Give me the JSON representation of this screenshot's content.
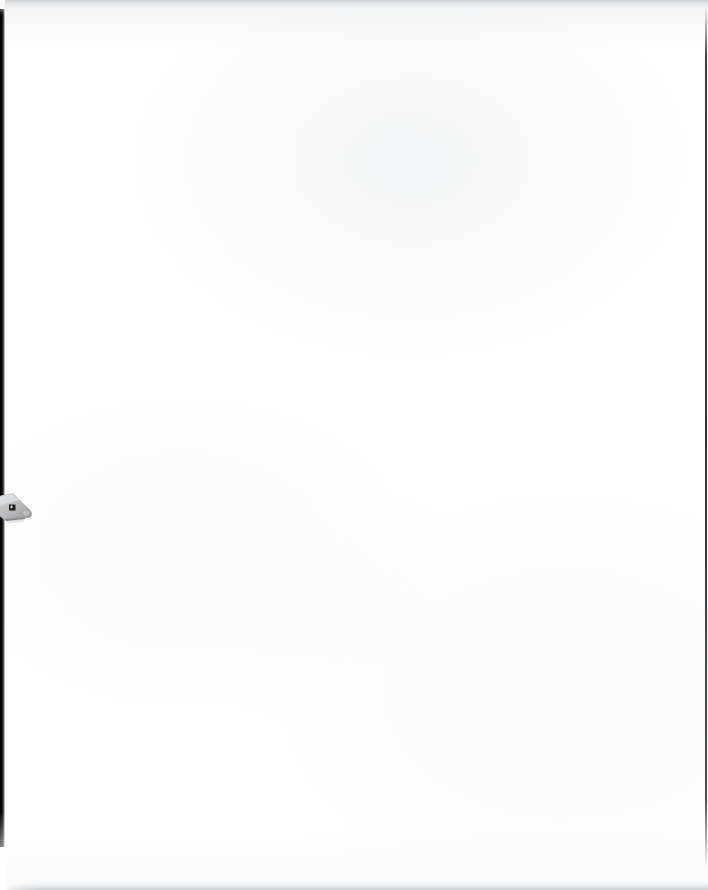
{
  "document": {
    "title": "Scanned Blank Page",
    "page_width": 708,
    "page_height": 890,
    "background_color": "#ffffff",
    "content_text": "",
    "description": "Blank scanned sheet with no printed text or figures"
  },
  "edges": {
    "left_stripe": {
      "label": "left-binding-shadow",
      "color": "#000000",
      "width_px": 5,
      "top_px": 9,
      "height_px": 838
    },
    "right_line": {
      "label": "right-page-edge",
      "color": "#2e3236",
      "width_px": 2,
      "top_px": 6,
      "height_px": 862
    },
    "top_band": {
      "label": "top-scan-band",
      "color": "#cfd2d4",
      "height_px": 11
    },
    "bottom_band": {
      "label": "bottom-scan-band",
      "color": "#c9ccce",
      "height_px": 9
    }
  },
  "artifact": {
    "name": "margin-tag-object",
    "description": "Small light-gray angled tag partially clipped by the left page edge",
    "body_color": "#b9bbbc",
    "highlight_color": "#d9dadb",
    "shadow_color": "#8e9091",
    "mark_color": "#1a1a1a",
    "x_px": 0,
    "y_px": 490,
    "width_px": 30,
    "height_px": 33
  }
}
